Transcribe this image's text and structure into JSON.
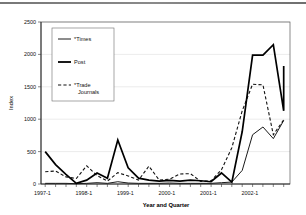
{
  "chart_data": {
    "type": "line",
    "title": "",
    "xlabel": "Year and Quarter",
    "ylabel": "Index",
    "ylim": [
      0,
      2500
    ],
    "yticks": [
      0,
      500,
      1000,
      1500,
      2000,
      2500
    ],
    "ytick_labels": [
      "0",
      "500",
      "1000",
      "1500",
      "2000",
      "2500"
    ],
    "grid": true,
    "legend_position": "upper-left-inside",
    "x": [
      "1997-1",
      "1997-2",
      "1997-3",
      "1997-4",
      "1998-1",
      "1998-2",
      "1998-3",
      "1998-4",
      "1999-1",
      "1999-2",
      "1999-3",
      "1999-4",
      "2000-1",
      "2000-2",
      "2000-3",
      "2000-4",
      "2001-1",
      "2001-2",
      "2001-3",
      "2001-4",
      "2002-1",
      "2002-2",
      "2002-3",
      "2002-4"
    ],
    "xtick_labels": [
      "1997-1",
      "1998-1",
      "1999-1",
      "2000-1",
      "2001-1",
      "2002-1"
    ],
    "xtick_indices": [
      0,
      4,
      8,
      12,
      16,
      20
    ],
    "series": [
      {
        "name": "*Times",
        "style": "solid-thin",
        "values": [
          10,
          10,
          10,
          5,
          10,
          20,
          10,
          35,
          15,
          10,
          10,
          10,
          15,
          10,
          10,
          10,
          10,
          20,
          30,
          210,
          760,
          880,
          700,
          980
        ]
      },
      {
        "name": "Post",
        "style": "solid-bold",
        "values": [
          500,
          300,
          150,
          10,
          60,
          170,
          90,
          680,
          250,
          90,
          60,
          45,
          55,
          45,
          60,
          50,
          35,
          170,
          30,
          810,
          1990,
          1990,
          2150,
          1130
        ]
      },
      {
        "name": "*Trade Journals",
        "style": "dashed",
        "values": [
          190,
          200,
          110,
          85,
          280,
          130,
          45,
          175,
          125,
          60,
          275,
          60,
          75,
          155,
          160,
          40,
          50,
          220,
          560,
          1130,
          1540,
          1530,
          760,
          990
        ]
      }
    ],
    "note_series_endpoint": {
      "post_last": 1820
    }
  },
  "legend": {
    "items": [
      {
        "label": "*Times",
        "marker": "solid-thin-line"
      },
      {
        "label": "Post",
        "marker": "solid-bold-line"
      },
      {
        "label": "*Trade",
        "label2": "Journals",
        "marker": "dashed-line"
      }
    ]
  },
  "axis": {
    "y_title": "Index",
    "x_title": "Year and Quarter"
  }
}
